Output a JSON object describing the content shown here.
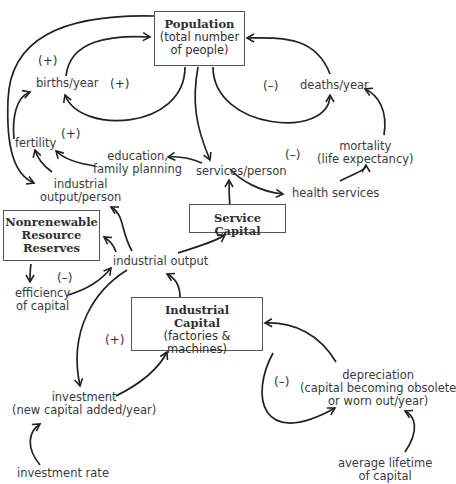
{
  "diagram": {
    "type": "causal-loop",
    "stocks": {
      "population": {
        "title": "Population",
        "subtitle_1": "(total number",
        "subtitle_2": "of people)"
      },
      "service_capital": {
        "title": "Service Capital"
      },
      "nonrenewable": {
        "title_1": "Nonrenewable",
        "title_2": "Resource",
        "title_3": "Reserves"
      },
      "industrial_capital": {
        "title_1": "Industrial",
        "title_2": "Capital",
        "subtitle": "(factories & machines)"
      }
    },
    "variables": {
      "births_year": "births/year",
      "deaths_year": "deaths/year",
      "fertility": "fertility",
      "education_1": "education,",
      "education_2": "family planning",
      "services_person": "services/person",
      "mortality_1": "mortality",
      "mortality_2": "(life expectancy)",
      "health_services": "health services",
      "ind_output_person_1": "industrial",
      "ind_output_person_2": "output/person",
      "industrial_output": "industrial output",
      "efficiency_1": "efficiency",
      "efficiency_2": "of capital",
      "investment_1": "investment",
      "investment_2": "(new capital added/year)",
      "investment_rate": "investment rate",
      "depreciation_1": "depreciation",
      "depreciation_2": "(capital becoming obsolete",
      "depreciation_3": "or worn out/year)",
      "lifetime_1": "average lifetime",
      "lifetime_2": "of capital"
    },
    "loop_signs": {
      "births_outer": "(+)",
      "births_inner": "(+)",
      "fertility": "(+)",
      "deaths": "(–)",
      "health": "(–)",
      "efficiency": "(–)",
      "investment": "(+)",
      "depreciation": "(–)"
    }
  }
}
